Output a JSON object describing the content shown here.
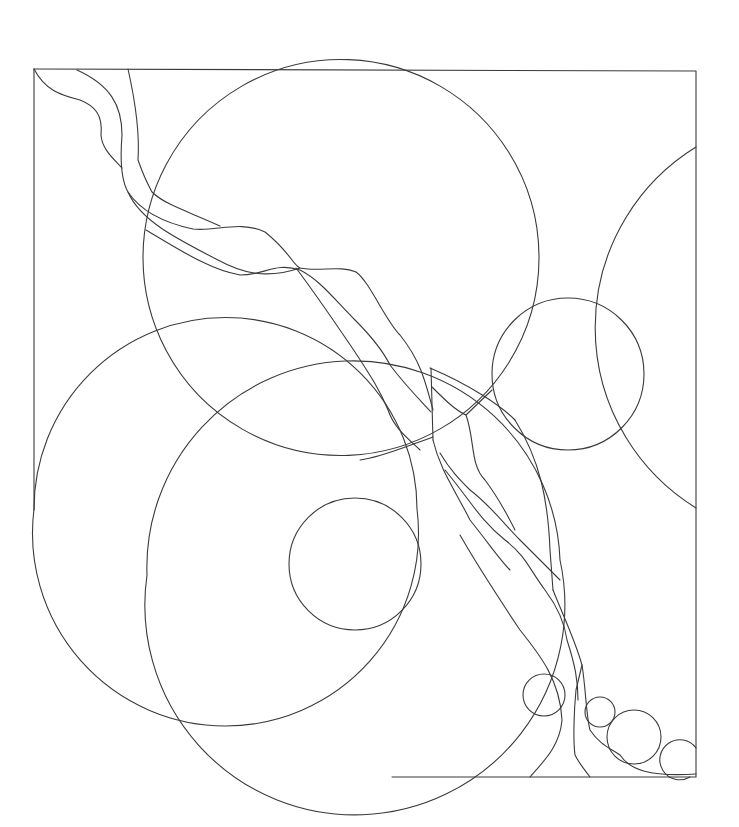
{
  "artwork": {
    "title": "Line-art coloring page: overlapping circles with flowing ribbon",
    "background": "#ffffff",
    "stroke": "#3a3a3a",
    "frame": {
      "x": 34,
      "y": 69,
      "width": 662,
      "height": 708
    },
    "circles": [
      {
        "name": "large-upper-circle",
        "cx": 341,
        "cy": 257,
        "r": 198
      },
      {
        "name": "left-large-circle",
        "cx": 224,
        "cy": 509,
        "r": 193
      },
      {
        "name": "center-large-circle",
        "cx": 354,
        "cy": 566,
        "r": 209
      },
      {
        "name": "inner-small-circle",
        "cx": 355,
        "cy": 564,
        "r": 66
      },
      {
        "name": "right-mid-circle",
        "cx": 568,
        "cy": 374,
        "r": 76
      },
      {
        "name": "right-edge-circle",
        "cx": 790,
        "cy": 328,
        "r": 212
      },
      {
        "name": "bubble-1",
        "cx": 544,
        "cy": 695,
        "r": 21
      },
      {
        "name": "bubble-2",
        "cx": 600,
        "cy": 712,
        "r": 15
      },
      {
        "name": "bubble-3",
        "cx": 634,
        "cy": 737,
        "r": 27
      },
      {
        "name": "bubble-4",
        "cx": 677,
        "cy": 760,
        "r": 20
      }
    ]
  }
}
